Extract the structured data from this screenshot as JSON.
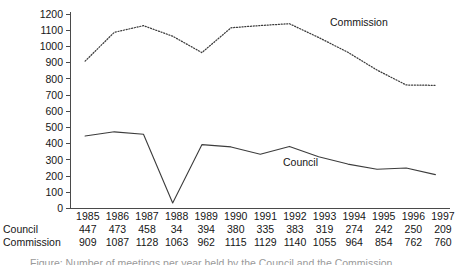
{
  "chart_data": {
    "type": "line",
    "title": "",
    "subtitle": "",
    "xlabel": "",
    "ylabel": "",
    "categories": [
      "1985",
      "1986",
      "1987",
      "1988",
      "1989",
      "1990",
      "1991",
      "1992",
      "1993",
      "1994",
      "1995",
      "1996",
      "1997"
    ],
    "ylim": [
      0,
      1200
    ],
    "yticks": [
      "0",
      "100",
      "200",
      "300",
      "400",
      "500",
      "600",
      "700",
      "800",
      "900",
      "1000",
      "1100",
      "1200"
    ],
    "grid": false,
    "legend_position": "inline-annotation",
    "series": [
      {
        "name": "Council",
        "style": "solid",
        "color": "#3c3c3c",
        "values": [
          447,
          473,
          458,
          34,
          394,
          380,
          335,
          383,
          319,
          274,
          242,
          250,
          209
        ]
      },
      {
        "name": "Commission",
        "style": "dotted",
        "color": "#3c3c3c",
        "values": [
          909,
          1087,
          1128,
          1063,
          962,
          1115,
          1129,
          1140,
          1055,
          964,
          854,
          762,
          760
        ]
      }
    ],
    "annotations": [
      {
        "text": "Commission",
        "x": 330,
        "y": 26
      },
      {
        "text": "Council",
        "x": 283,
        "y": 166
      }
    ]
  },
  "table": {
    "row_header_blank": "",
    "years": [
      "1985",
      "1986",
      "1987",
      "1988",
      "1989",
      "1990",
      "1991",
      "1992",
      "1993",
      "1994",
      "1995",
      "1996",
      "1997"
    ],
    "rows": [
      {
        "label": "Council",
        "values": [
          "447",
          "473",
          "458",
          "34",
          "394",
          "380",
          "335",
          "383",
          "319",
          "274",
          "242",
          "250",
          "209"
        ]
      },
      {
        "label": "Commission",
        "values": [
          "909",
          "1087",
          "1128",
          "1063",
          "962",
          "1115",
          "1129",
          "1140",
          "1055",
          "964",
          "854",
          "762",
          "760"
        ]
      }
    ]
  },
  "caption": {
    "text": "Figure: Number of meetings per year held by the Council and the Commission"
  }
}
